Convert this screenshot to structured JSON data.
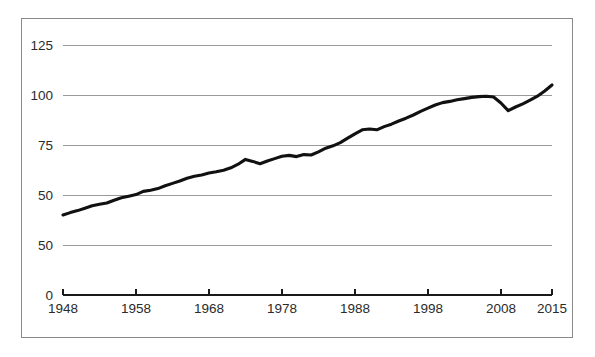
{
  "chart_data": {
    "type": "line",
    "title": "",
    "subtitle": "",
    "xlabel": "",
    "ylabel": "",
    "xlim": [
      1948,
      2015
    ],
    "ylim": [
      0,
      131
    ],
    "grid": true,
    "legend": false,
    "legend_position": "none",
    "line_color": "#111111",
    "gridline_color": "#9a9a9a",
    "frame_color": "#8a8a8a",
    "background_color": "#ffffff",
    "y_ticks": [
      {
        "label": "0",
        "value": 0
      },
      {
        "label": "50",
        "value": 25
      },
      {
        "label": "50",
        "value": 50
      },
      {
        "label": "75",
        "value": 75
      },
      {
        "label": "100",
        "value": 100
      },
      {
        "label": "125",
        "value": 125
      }
    ],
    "x_ticks": [
      {
        "label": "1948",
        "value": 1948
      },
      {
        "label": "1958",
        "value": 1958
      },
      {
        "label": "1968",
        "value": 1968
      },
      {
        "label": "1978",
        "value": 1978
      },
      {
        "label": "1988",
        "value": 1988
      },
      {
        "label": "1998",
        "value": 1998
      },
      {
        "label": "2008",
        "value": 2008
      },
      {
        "label": "2015",
        "value": 2015
      }
    ],
    "x": [
      1948,
      1949,
      1950,
      1951,
      1952,
      1953,
      1954,
      1955,
      1956,
      1957,
      1958,
      1959,
      1960,
      1961,
      1962,
      1963,
      1964,
      1965,
      1966,
      1967,
      1968,
      1969,
      1970,
      1971,
      1972,
      1973,
      1974,
      1975,
      1976,
      1977,
      1978,
      1979,
      1980,
      1981,
      1982,
      1983,
      1984,
      1985,
      1986,
      1987,
      1988,
      1989,
      1990,
      1991,
      1992,
      1993,
      1994,
      1995,
      1996,
      1997,
      1998,
      1999,
      2000,
      2001,
      2002,
      2003,
      2004,
      2005,
      2006,
      2007,
      2008,
      2009,
      2010,
      2011,
      2012,
      2013,
      2014,
      2015
    ],
    "series": [
      {
        "name": "index",
        "values": [
          40.0,
          41.2,
          42.2,
          43.4,
          44.6,
          45.4,
          46.0,
          47.4,
          48.6,
          49.4,
          50.2,
          51.8,
          52.4,
          53.2,
          54.6,
          55.8,
          57.0,
          58.4,
          59.4,
          60.0,
          61.0,
          61.6,
          62.4,
          63.6,
          65.4,
          67.8,
          66.8,
          65.6,
          67.0,
          68.2,
          69.4,
          69.8,
          69.2,
          70.2,
          70.0,
          71.6,
          73.4,
          74.6,
          76.2,
          78.4,
          80.6,
          82.6,
          83.0,
          82.6,
          84.2,
          85.4,
          87.0,
          88.4,
          90.0,
          91.8,
          93.4,
          95.0,
          96.2,
          96.8,
          97.6,
          98.2,
          98.8,
          99.2,
          99.4,
          99.0,
          96.0,
          92.2,
          94.0,
          95.6,
          97.4,
          99.4,
          102.0,
          105.0
        ]
      }
    ]
  },
  "axes": {
    "y_axis_name": "y-axis",
    "x_axis_name": "x-axis"
  }
}
